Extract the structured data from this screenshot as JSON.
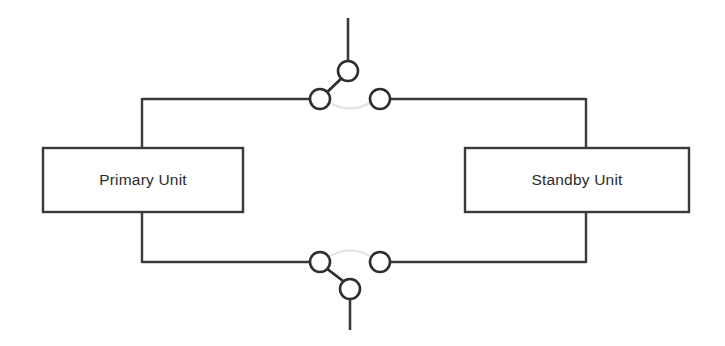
{
  "diagram": {
    "type": "schematic",
    "canvas": {
      "width": 725,
      "height": 346,
      "background": "#ffffff"
    },
    "stroke_color": "#3a3a3a",
    "contact_stroke_color": "#2e2e2e",
    "ghost_arc_color": "#e2e2e2",
    "blocks": [
      {
        "id": "primary-unit",
        "label": "Primary Unit",
        "x": 43,
        "y": 148,
        "width": 200,
        "height": 64,
        "label_x": 143,
        "label_y": 181
      },
      {
        "id": "standby-unit",
        "label": "Standby Unit",
        "x": 465,
        "y": 148,
        "width": 224,
        "height": 64,
        "label_x": 577,
        "label_y": 181
      }
    ],
    "buses": [
      {
        "id": "top-bus-left",
        "from_x": 142,
        "from_y": 99,
        "to_x": 320,
        "to_y": 99
      },
      {
        "id": "top-bus-right",
        "from_x": 380,
        "from_y": 99,
        "to_x": 586,
        "to_y": 99
      },
      {
        "id": "bottom-bus-left",
        "from_x": 142,
        "from_y": 262,
        "to_x": 320,
        "to_y": 262
      },
      {
        "id": "bottom-bus-right",
        "from_x": 380,
        "from_y": 262,
        "to_x": 586,
        "to_y": 262
      }
    ],
    "risers": [
      {
        "id": "primary-top-riser",
        "x": 142,
        "from_y": 99,
        "to_y": 148
      },
      {
        "id": "primary-bottom-riser",
        "x": 142,
        "from_y": 212,
        "to_y": 262
      },
      {
        "id": "standby-top-riser",
        "x": 586,
        "from_y": 99,
        "to_y": 148
      },
      {
        "id": "standby-bottom-riser",
        "x": 586,
        "from_y": 212,
        "to_y": 262
      }
    ],
    "switches": [
      {
        "id": "top-changeover-switch",
        "position": "top",
        "left_contact": {
          "cx": 320,
          "cy": 99,
          "r": 10
        },
        "right_contact": {
          "cx": 380,
          "cy": 99,
          "r": 10
        },
        "pivot_contact": {
          "cx": 348,
          "cy": 71,
          "r": 10
        },
        "blade_from_x": 322,
        "blade_from_y": 97,
        "blade_to_x": 345,
        "blade_to_y": 75,
        "arc_path": "M 330 103 Q 350 114 370 103",
        "stub_x": 348,
        "stub_from_y": 18,
        "stub_to_y": 61
      },
      {
        "id": "bottom-changeover-switch",
        "position": "bottom",
        "left_contact": {
          "cx": 320,
          "cy": 262,
          "r": 10
        },
        "right_contact": {
          "cx": 380,
          "cy": 262,
          "r": 10
        },
        "pivot_contact": {
          "cx": 350,
          "cy": 289,
          "r": 10
        },
        "blade_from_x": 326,
        "blade_from_y": 268,
        "blade_to_x": 347,
        "blade_to_y": 284,
        "arc_path": "M 330 256 Q 350 245 370 256",
        "stub_x": 350,
        "stub_from_y": 299,
        "stub_to_y": 330
      }
    ]
  }
}
